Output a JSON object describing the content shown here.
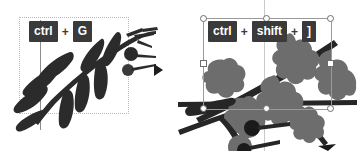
{
  "screenshot": {
    "width": 357,
    "height": 151,
    "background_color": "#ffffff",
    "description": "Two-panel vector editor illustration comparing grouping and arrange shortcuts"
  },
  "panels": {
    "left": {
      "name": "before-panel",
      "selection_type": "dotted-marquee",
      "shortcut": {
        "keys": [
          "ctrl",
          "G"
        ],
        "separator": "+",
        "full_text": "ctrl + G"
      },
      "artwork": {
        "name": "fern-branch",
        "leaf_shape": "teardrop",
        "leaf_color": "#2e2e2e",
        "stem_color": "#2a2a2a",
        "berry_count": 2,
        "berry_color": "#2a2a2a"
      }
    },
    "divider": {
      "name": "flow-arrow",
      "glyph": "▶",
      "color": "#1d1d1d"
    },
    "right": {
      "name": "after-panel",
      "selection_type": "transform-box-with-handles",
      "handle_count": 8,
      "handle_fill": "#ffffff",
      "handle_stroke": "#6e6e6e",
      "shortcut": {
        "keys": [
          "ctrl",
          "shift",
          "]"
        ],
        "separator": "+",
        "full_text": "ctrl + shift + ]"
      },
      "artwork": {
        "name": "oak-branch",
        "leaf_shape": "oak-lobed",
        "leaf_color": "#6d6d6d",
        "stem_color": "#262626",
        "berry_count": 2,
        "berry_outer_color": "#6d6d6d",
        "berry_inner_color": "#1a1a1a"
      }
    }
  },
  "key_badge_style": {
    "background": "#3a3a3a",
    "text_color": "#ffffff"
  }
}
